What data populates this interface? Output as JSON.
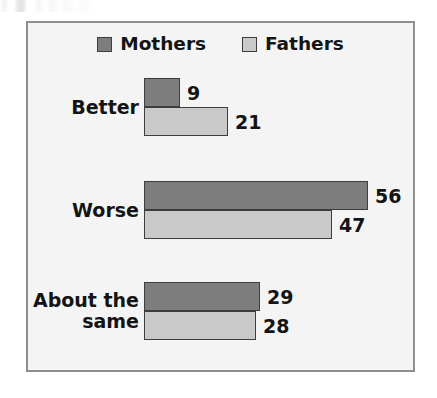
{
  "chart_data": {
    "type": "bar",
    "orientation": "horizontal",
    "title": "",
    "subtitle": "",
    "xlabel": "",
    "ylabel": "",
    "grid": false,
    "legend_position": "top-center",
    "xlim": [
      0,
      60
    ],
    "categories": [
      "Better",
      "Worse",
      "About the\nsame"
    ],
    "series": [
      {
        "name": "Mothers",
        "color": "#7d7d7d",
        "values": [
          9,
          56,
          29
        ]
      },
      {
        "name": "Fathers",
        "color": "#c9c9c9",
        "values": [
          21,
          47,
          28
        ]
      }
    ],
    "data_labels": [
      "9",
      "21",
      "56",
      "47",
      "29",
      "28"
    ]
  },
  "legend": {
    "entries": [
      {
        "label": "Mothers",
        "swatch": "dark-gray-square-icon"
      },
      {
        "label": "Fathers",
        "swatch": "light-gray-square-icon"
      }
    ]
  },
  "groups": [
    {
      "category_line1": "Better",
      "category_line2": "",
      "mothers_value": "9",
      "fathers_value": "21"
    },
    {
      "category_line1": "Worse",
      "category_line2": "",
      "mothers_value": "56",
      "fathers_value": "47"
    },
    {
      "category_line1": "About the",
      "category_line2": "same",
      "mothers_value": "29",
      "fathers_value": "28"
    }
  ],
  "colors": {
    "mothers": "#7d7d7d",
    "fathers": "#c9c9c9",
    "bar_outline": "#3d3d3d",
    "frame_border": "#8e8e8e",
    "plot_background": "#f4f4f4",
    "page_background": "#ffffff",
    "text": "#141414"
  }
}
